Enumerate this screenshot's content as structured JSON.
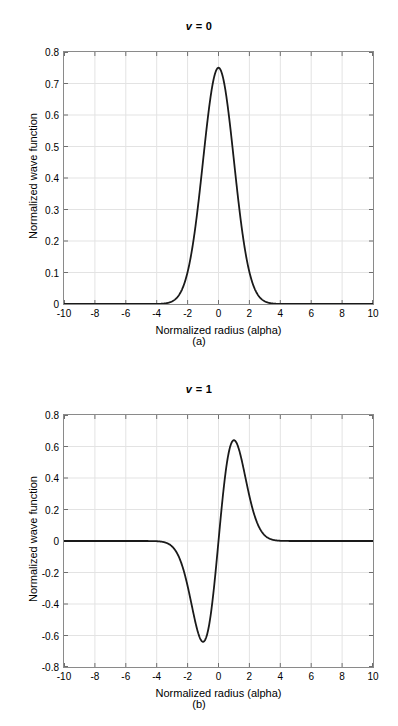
{
  "figure": {
    "panels": [
      {
        "id": "a",
        "title_prefix": "v",
        "title_rest": " = 0",
        "subcaption": "(a)"
      },
      {
        "id": "b",
        "title_prefix": "v",
        "title_rest": " = 1",
        "subcaption": "(b)"
      }
    ]
  },
  "chart_data": [
    {
      "type": "line",
      "title": "v = 0",
      "subcaption": "(a)",
      "xlabel": "Normalized radius (alpha)",
      "ylabel": "Normalized wave function",
      "xlim": [
        -10,
        10
      ],
      "ylim": [
        0,
        0.8
      ],
      "xticks": [
        -10,
        -8,
        -6,
        -4,
        -2,
        0,
        2,
        4,
        6,
        8,
        10
      ],
      "xticklabels": [
        "-10",
        "-8",
        "-6",
        "-4",
        "-2",
        "0",
        "2",
        "4",
        "6",
        "8",
        "10"
      ],
      "yticks": [
        0,
        0.1,
        0.2,
        0.3,
        0.4,
        0.5,
        0.6,
        0.7,
        0.8
      ],
      "yticklabels": [
        "0",
        "0.1",
        "0.2",
        "0.3",
        "0.4",
        "0.5",
        "0.6",
        "0.7",
        "0.8"
      ],
      "grid": true,
      "legend": null,
      "line_color": "#1a1a1a",
      "line_width": 1.8,
      "peak_value": 0.75,
      "peak_x": 0,
      "series": [
        {
          "name": "v = 0 wave function",
          "x": [
            -10,
            -9.5,
            -9,
            -8.5,
            -8,
            -7.5,
            -7,
            -6.5,
            -6,
            -5.5,
            -5,
            -4.75,
            -4.5,
            -4.25,
            -4,
            -3.75,
            -3.5,
            -3.25,
            -3,
            -2.75,
            -2.5,
            -2.25,
            -2,
            -1.75,
            -1.5,
            -1.25,
            -1,
            -0.75,
            -0.5,
            -0.25,
            0,
            0.25,
            0.5,
            0.75,
            1,
            1.25,
            1.5,
            1.75,
            2,
            2.25,
            2.5,
            2.75,
            3,
            3.25,
            3.5,
            3.75,
            4,
            4.25,
            4.5,
            4.75,
            5,
            5.5,
            6,
            6.5,
            7,
            7.5,
            8,
            8.5,
            9,
            9.5,
            10
          ],
          "y": [
            0,
            0,
            0,
            0,
            0,
            0,
            0,
            0,
            0,
            0,
            1e-07,
            1.5e-06,
            1.28e-05,
            9.45e-05,
            0.0006,
            0.0033,
            0.0159,
            0.0066,
            0.0083,
            0.0237,
            0.0335,
            0.0638,
            0.1015,
            0.1558,
            0.2258,
            0.3108,
            0.4085,
            0.5064,
            0.5963,
            0.6722,
            0.75,
            0.6722,
            0.5963,
            0.5064,
            0.4085,
            0.3108,
            0.2258,
            0.1558,
            0.1015,
            0.0638,
            0.0335,
            0.0237,
            0.0083,
            0.0066,
            0.0159,
            0.0033,
            0.0006,
            9.45e-05,
            1.28e-05,
            1.5e-06,
            1e-07,
            0,
            0,
            0,
            0,
            0,
            0,
            0,
            0,
            0,
            0
          ]
        }
      ]
    },
    {
      "type": "line",
      "title": "v = 1",
      "subcaption": "(b)",
      "xlabel": "Normalized radius (alpha)",
      "ylabel": "Normalized wave function",
      "xlim": [
        -10,
        10
      ],
      "ylim": [
        -0.8,
        0.8
      ],
      "xticks": [
        -10,
        -8,
        -6,
        -4,
        -2,
        0,
        2,
        4,
        6,
        8,
        10
      ],
      "xticklabels": [
        "-10",
        "-8",
        "-6",
        "-4",
        "-2",
        "0",
        "2",
        "4",
        "6",
        "8",
        "10"
      ],
      "yticks": [
        -0.8,
        -0.6,
        -0.4,
        -0.2,
        0,
        0.2,
        0.4,
        0.6,
        0.8
      ],
      "yticklabels": [
        "-0.8",
        "-0.6",
        "-0.4",
        "-0.2",
        "0",
        "0.2",
        "0.4",
        "0.6",
        "0.8"
      ],
      "grid": true,
      "legend": null,
      "line_color": "#1a1a1a",
      "line_width": 1.8,
      "peak_value": 0.64,
      "peak_x": 1,
      "trough_value": -0.64,
      "trough_x": -1,
      "series": [
        {
          "name": "v = 1 wave function",
          "x": [
            -10,
            -9,
            -8,
            -7,
            -6,
            -5.5,
            -5,
            -4.75,
            -4.5,
            -4.25,
            -4,
            -3.75,
            -3.5,
            -3.25,
            -3,
            -2.75,
            -2.5,
            -2.25,
            -2,
            -1.75,
            -1.5,
            -1.25,
            -1,
            -0.75,
            -0.5,
            -0.25,
            0,
            0.25,
            0.5,
            0.75,
            1,
            1.25,
            1.5,
            1.75,
            2,
            2.25,
            2.5,
            2.75,
            3,
            3.25,
            3.5,
            3.75,
            4,
            4.25,
            4.5,
            4.75,
            5,
            5.5,
            6,
            7,
            8,
            9,
            10
          ],
          "y": [
            0,
            0,
            0,
            0,
            0,
            -8e-07,
            -6.7e-06,
            -1.85e-05,
            -4.96e-05,
            -0.0001284,
            -0.0003205,
            -0.0007718,
            -0.0017917,
            -0.0040084,
            -0.0086364,
            -0.0179141,
            -0.0357205,
            -0.0684076,
            -0.1255886,
            -0.2205871,
            -0.3692504,
            -0.5868,
            -0.64,
            -0.5868,
            -0.4284,
            -0.2205,
            0,
            0.2205,
            0.4284,
            0.5868,
            0.64,
            0.5868,
            0.3692504,
            0.2205871,
            0.1255886,
            0.0684076,
            0.0357205,
            0.0179141,
            0.0086364,
            0.0040084,
            0.0017917,
            0.0007718,
            0.0003205,
            0.0001284,
            4.96e-05,
            1.85e-05,
            6.7e-06,
            8e-07,
            0,
            0,
            0,
            0,
            0
          ]
        }
      ]
    }
  ]
}
